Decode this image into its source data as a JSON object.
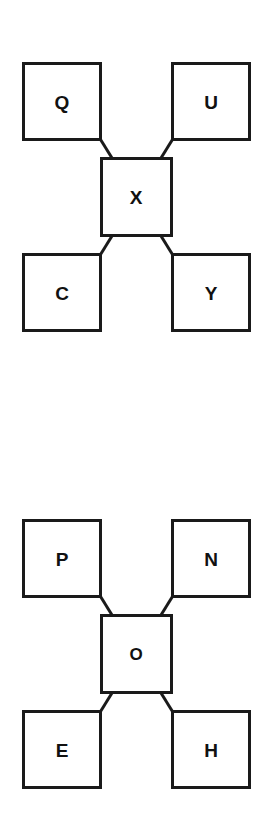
{
  "page": {
    "background_color": "#ffffff",
    "stroke_color": "#1a1a1a",
    "text_color": "#111111",
    "width": 269,
    "height": 823
  },
  "diagrams": [
    {
      "id": "diagram-top",
      "name": "x-centered-node-diagram-1",
      "center": {
        "label": "X"
      },
      "nodes": [
        {
          "position": "top-left",
          "label": "Q"
        },
        {
          "position": "top-right",
          "label": "U"
        },
        {
          "position": "bottom-left",
          "label": "C"
        },
        {
          "position": "bottom-right",
          "label": "Y"
        }
      ],
      "connectors": [
        {
          "from": "center",
          "to": "top-left"
        },
        {
          "from": "center",
          "to": "top-right"
        },
        {
          "from": "center",
          "to": "bottom-left"
        },
        {
          "from": "center",
          "to": "bottom-right"
        }
      ]
    },
    {
      "id": "diagram-bottom",
      "name": "o-centered-node-diagram-2",
      "center": {
        "label": "O"
      },
      "nodes": [
        {
          "position": "top-left",
          "label": "P"
        },
        {
          "position": "top-right",
          "label": "N"
        },
        {
          "position": "bottom-left",
          "label": "E"
        },
        {
          "position": "bottom-right",
          "label": "H"
        }
      ],
      "connectors": [
        {
          "from": "center",
          "to": "top-left"
        },
        {
          "from": "center",
          "to": "top-right"
        },
        {
          "from": "center",
          "to": "bottom-left"
        },
        {
          "from": "center",
          "to": "bottom-right"
        }
      ]
    }
  ]
}
